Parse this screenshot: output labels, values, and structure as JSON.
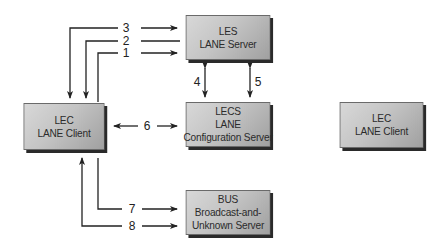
{
  "diagram": {
    "nodes": {
      "les": {
        "lines": [
          "LES",
          "LANE Server"
        ]
      },
      "lecs": {
        "lines": [
          "LECS",
          "LANE",
          "Configuration Server"
        ]
      },
      "lec_left": {
        "lines": [
          "LEC",
          "LANE Client"
        ]
      },
      "lec_right": {
        "lines": [
          "LEC",
          "LANE Client"
        ]
      },
      "bus": {
        "lines": [
          "BUS",
          "Broadcast-and-",
          "Unknown Server"
        ]
      }
    },
    "connections": [
      {
        "label": "1",
        "from": "lec_left",
        "to": "les"
      },
      {
        "label": "2",
        "from": "les",
        "to": "lec_left"
      },
      {
        "label": "3",
        "from": "les",
        "to": "lec_left"
      },
      {
        "label": "4",
        "from": "les",
        "to": "lecs",
        "bidirectional": true
      },
      {
        "label": "5",
        "from": "les",
        "to": "lecs",
        "bidirectional": true
      },
      {
        "label": "6",
        "from": "lec_left",
        "to": "lecs",
        "bidirectional": true
      },
      {
        "label": "7",
        "from": "lec_left",
        "to": "bus"
      },
      {
        "label": "8",
        "from": "lec_left",
        "to": "bus",
        "return_to": "lec_left"
      }
    ]
  }
}
